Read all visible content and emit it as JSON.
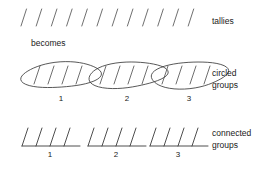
{
  "diagram": {
    "rows": [
      {
        "id": "tallies-row",
        "right_label": "tallies",
        "mark_count": 12,
        "marks_start_x": 21,
        "mark_spacing": 15.2,
        "baseline_y": 26,
        "mark_height": 17,
        "mark_slant": 5.5
      },
      {
        "id": "circled-groups-row",
        "right_label_line1": "circled",
        "right_label_line2": "groups",
        "group_count": 3,
        "marks_per_group": 4,
        "group_numbers": [
          "1",
          "2",
          "3"
        ],
        "group_starts": [
          22,
          88,
          150
        ],
        "ellipse_width": 78,
        "ellipse_height": 26,
        "baseline_y": 90,
        "mark_spacing": 14
      },
      {
        "id": "connected-groups-row",
        "right_label_line1": "connected",
        "right_label_line2": "groups",
        "group_count": 3,
        "marks_per_group": 4,
        "group_numbers": [
          "1",
          "2",
          "3"
        ],
        "group_starts": [
          22,
          88,
          150
        ],
        "baseline_y": 146,
        "mark_height": 18,
        "mark_spacing": 14,
        "mark_slant": 6
      }
    ],
    "connector_text": "becomes",
    "colors": {
      "ink": "#3a3a3a",
      "text": "#1a1a1a",
      "background": "#ffffff"
    }
  }
}
